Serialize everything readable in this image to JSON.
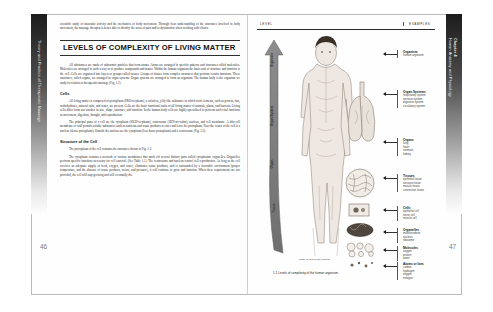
{
  "book": {
    "left_tab_text": "Theory and Practice of Therapeutic Massage",
    "right_tab_chapter": "Chapter 4",
    "right_tab_title": "Human Anatomy and Physiology",
    "left_folio": "46",
    "right_folio": "47"
  },
  "left_page": {
    "intro_paragraph": "scientific study of muscular activity and the mechanics of body movement. Through clear understanding of the structures involved in body movement, the massage therapist is better able to identify the areas of pain and/or dysfunction when working with clients.",
    "section_heading": "LEVELS OF COMPLEXITY OF LIVING MATTER",
    "body_paragraph_1": "All substances are made of subatomic particles that form atoms. Atoms are arranged in specific patterns and structures called molecules. Molecules are arranged in such a way as to produce compounds and matter. Within the human organism the basic unit of structure and function is the cell. Cells are organized into layers or groups called tissues. Groups of tissues form complex structures that perform certain functions. These structures, called organs, are arranged in organ systems. Organ systems are arranged to form an organism. The human body is the organism we study in relation to therapeutic massage (Fig. 1.1).",
    "subheading_cells": "Cells",
    "cells_paragraph_1": "All living matter is composed of protoplasm (PRO-to-plazm), a colorless, jelly-like substance in which food elements, such as protein, fats, carbohydrates, mineral salts, and water, are present. Cells are the basic functional units of all living matter of animals, plants, and bacteria. Living cells differ from one another in size, shape, structure, and function. In the human body cells are highly specialized to perform such vital functions as movement, digestion, thought, and reproduction.",
    "cells_paragraph_2": "The principal parts of a cell are the cytoplasm (SIGH-to-plazm), centrosome (SEN-tro-sohm), nucleus, and cell membrane. A thin cell membrane or wall permits soluble substances such as nutrients and waste products to enter and leave the protoplasm. Near the center of the cell is a nucleus (dense protoplasm). Outside the nucleus are the cytoplasm (less dense protoplasm) and a centrosome (Fig. 1.2).",
    "subheading_structure": "Structure of the Cell",
    "structure_paragraph_1": "The protoplasm of the cell contains the structures shown in Fig. 1.2.",
    "structure_paragraph_2": "The cytoplasm contains a network of various membranes that mark off several distinct parts called cytoplasmic organelles. Organelles perform specific functions necessary for cell survival. (See Table 1.1.) The centrosome and nucleus control cell reproduction. As long as the cell receives an adequate supply of food, oxygen, and water, eliminates waste products, and is surrounded by a favorable environment (proper temperature, and the absence of waste products, toxins, and pressure), it will continue to grow and function. When these requirements are not provided, the cell will stop growing and will eventually die."
  },
  "figure": {
    "column_header_level": "LEVEL",
    "column_header_examples": "EXAMPLES",
    "arrow_labels": [
      "Organism",
      "Organ System",
      "Organ",
      "Tissue"
    ],
    "body_note": "Made of cells\nof an element",
    "caption": "1-1  Levels of complexity of the human organism.",
    "levels": [
      {
        "title": "Organism",
        "items": [
          "human organism"
        ],
        "top": 28
      },
      {
        "title": "Organ Systems",
        "items": [
          "respiratory system",
          "nervous system",
          "digestive system",
          "circulatory system"
        ],
        "top": 68
      },
      {
        "title": "Organs",
        "items": [
          "lung",
          "heart",
          "stomach",
          "kidney"
        ],
        "top": 116
      },
      {
        "title": "Tissues",
        "items": [
          "epithelial tissue",
          "nervous tissue",
          "muscle tissue",
          "connective tissue"
        ],
        "top": 152
      },
      {
        "title": "Cells",
        "items": [
          "epithelial cell",
          "nerve cell",
          "muscle cell"
        ],
        "top": 184
      },
      {
        "title": "Organelles",
        "items": [
          "mitochondrion",
          "nucleus",
          "ribosome"
        ],
        "top": 206
      },
      {
        "title": "Molecules",
        "items": [
          "oxygen",
          "protein",
          "water"
        ],
        "top": 224
      },
      {
        "title": "Atoms or Ions",
        "items": [
          "carbon",
          "hydrogen",
          "oxygen",
          "nitrogen"
        ],
        "top": 240
      }
    ]
  }
}
